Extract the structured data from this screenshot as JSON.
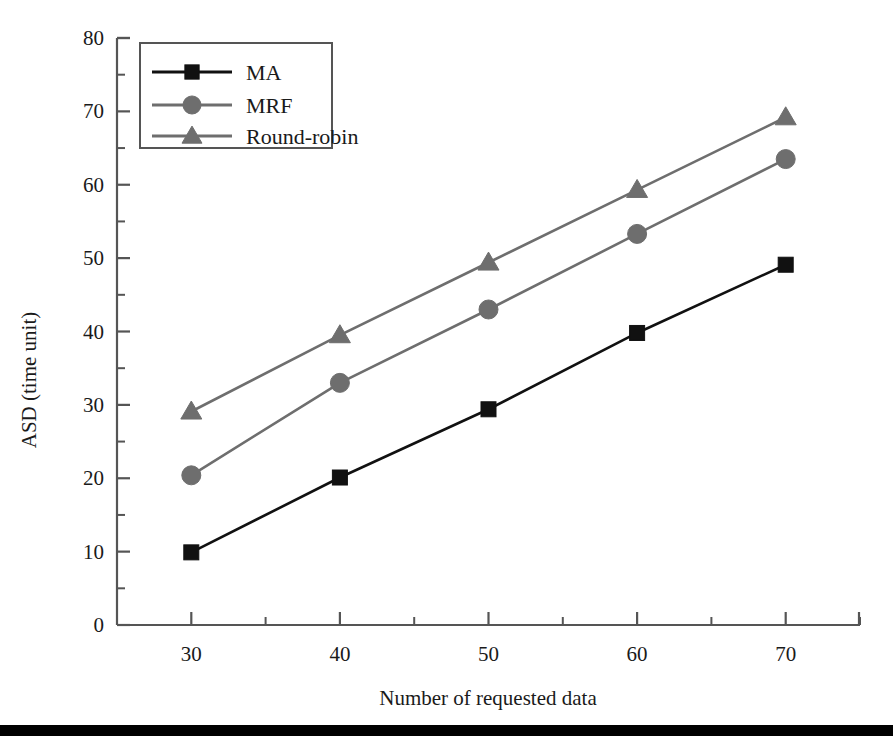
{
  "chart_data": {
    "type": "line",
    "title": "",
    "xlabel": "Number of requested data",
    "ylabel": "ASD (time unit)",
    "x": [
      30,
      40,
      50,
      60,
      70
    ],
    "xlim": [
      25,
      75
    ],
    "ylim": [
      0,
      80
    ],
    "xticks": [
      30,
      40,
      50,
      60,
      70
    ],
    "xtick_labels": [
      "30",
      "40",
      "50",
      "60",
      "70"
    ],
    "xminor_ticks": [
      25,
      35,
      45,
      55,
      65,
      75
    ],
    "yticks": [
      0,
      10,
      20,
      30,
      40,
      50,
      60,
      70,
      80
    ],
    "ytick_labels": [
      "0",
      "10",
      "20",
      "30",
      "40",
      "50",
      "60",
      "70",
      "80"
    ],
    "yminor_ticks": [
      5,
      15,
      25,
      35,
      45,
      55,
      65,
      75
    ],
    "grid": false,
    "legend_position": "upper left",
    "series": [
      {
        "name": "MA",
        "marker": "square",
        "color": "#111111",
        "values": [
          9.9,
          20.1,
          29.4,
          39.8,
          49.1
        ]
      },
      {
        "name": "MRF",
        "marker": "circle",
        "color": "#6e6e6e",
        "values": [
          20.4,
          33.0,
          43.0,
          53.3,
          63.5
        ]
      },
      {
        "name": "Round-robin",
        "marker": "triangle",
        "color": "#6e6e6e",
        "values": [
          29.1,
          39.5,
          49.4,
          59.3,
          69.2
        ]
      }
    ]
  },
  "legend": {
    "entries": [
      {
        "label": "MA"
      },
      {
        "label": "MRF"
      },
      {
        "label": "Round-robin"
      }
    ]
  },
  "axes": {
    "y_title": "ASD (time unit)",
    "x_title": "Number of requested data",
    "y_labels": [
      "80",
      "70",
      "60",
      "50",
      "40",
      "30",
      "20",
      "10",
      "0"
    ],
    "x_labels": [
      "30",
      "40",
      "50",
      "60",
      "70"
    ]
  },
  "colors": {
    "ma_series": "#111111",
    "mrf_series": "#6e6e6e",
    "roundrobin_series": "#6e6e6e",
    "axis": "#555555",
    "text": "#1a1a1a",
    "footer_rule": "#000000"
  }
}
